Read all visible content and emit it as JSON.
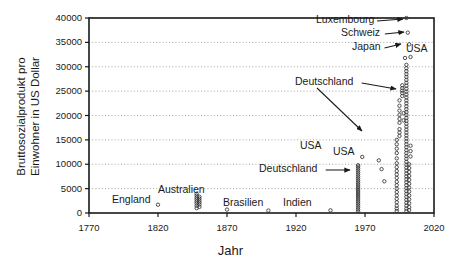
{
  "chart_data": {
    "type": "scatter",
    "title": "",
    "xlabel": "Jahr",
    "ylabel": "Bruttosozialprodukt pro Einwohner in US Dollar",
    "ylabel_line1": "Bruttosozialprodukt pro",
    "ylabel_line2": "Einwohner in US Dollar",
    "xlim": [
      1770,
      2020
    ],
    "ylim": [
      0,
      40000
    ],
    "xticks": [
      1770,
      1820,
      1870,
      1920,
      1970,
      2020
    ],
    "yticks": [
      0,
      5000,
      10000,
      15000,
      20000,
      25000,
      30000,
      35000,
      40000
    ],
    "xtick_labels": [
      "1770",
      "1820",
      "1870",
      "1920",
      "1970",
      "2020"
    ],
    "ytick_labels": [
      "0",
      "5000",
      "10000",
      "15000",
      "20000",
      "25000",
      "30000",
      "35000",
      "40000"
    ],
    "grid": "horizontal-dotted",
    "legend": "none",
    "marker": "open-circle",
    "marker_color": "#333333",
    "points": [
      [
        1820,
        1700
      ],
      [
        1848,
        1000
      ],
      [
        1848,
        1500
      ],
      [
        1848,
        1950
      ],
      [
        1848,
        2350
      ],
      [
        1848,
        2750
      ],
      [
        1848,
        3150
      ],
      [
        1848,
        3550
      ],
      [
        1848,
        3950
      ],
      [
        1850,
        2550
      ],
      [
        1850,
        1250
      ],
      [
        1850,
        1750
      ],
      [
        1850,
        2150
      ],
      [
        1850,
        2950
      ],
      [
        1850,
        3350
      ],
      [
        1870,
        700
      ],
      [
        1900,
        500
      ],
      [
        1945,
        550
      ],
      [
        1965,
        300
      ],
      [
        1965,
        700
      ],
      [
        1965,
        1100
      ],
      [
        1965,
        1500
      ],
      [
        1965,
        1900
      ],
      [
        1965,
        2300
      ],
      [
        1965,
        2700
      ],
      [
        1965,
        3100
      ],
      [
        1965,
        3500
      ],
      [
        1965,
        3900
      ],
      [
        1965,
        4300
      ],
      [
        1965,
        4700
      ],
      [
        1965,
        5100
      ],
      [
        1965,
        5500
      ],
      [
        1965,
        5900
      ],
      [
        1965,
        6300
      ],
      [
        1965,
        6700
      ],
      [
        1965,
        7100
      ],
      [
        1965,
        7500
      ],
      [
        1965,
        7900
      ],
      [
        1965,
        8300
      ],
      [
        1965,
        8700
      ],
      [
        1965,
        9100
      ],
      [
        1965,
        9500
      ],
      [
        1965,
        9800
      ],
      [
        1968,
        11500
      ],
      [
        1980,
        10800
      ],
      [
        1982,
        9000
      ],
      [
        1984,
        6500
      ],
      [
        1993,
        12300
      ],
      [
        1993,
        10200
      ],
      [
        1993,
        11200
      ],
      [
        1993,
        9400
      ],
      [
        1993,
        8600
      ],
      [
        1993,
        7900
      ],
      [
        1993,
        7200
      ],
      [
        1993,
        6400
      ],
      [
        1993,
        5700
      ],
      [
        1993,
        5000
      ],
      [
        1993,
        4300
      ],
      [
        1993,
        3600
      ],
      [
        1993,
        2900
      ],
      [
        1993,
        2200
      ],
      [
        1993,
        1500
      ],
      [
        1993,
        900
      ],
      [
        1993,
        400
      ],
      [
        1993,
        13200
      ],
      [
        1993,
        14100
      ],
      [
        1993,
        15000
      ],
      [
        1995,
        17200
      ],
      [
        1995,
        16500
      ],
      [
        1995,
        15800
      ],
      [
        1995,
        20100
      ],
      [
        1995,
        21000
      ],
      [
        1995,
        19300
      ],
      [
        1995,
        18500
      ],
      [
        1995,
        22000
      ],
      [
        1995,
        23100
      ],
      [
        1997,
        24000
      ],
      [
        1997,
        24600
      ],
      [
        1997,
        25100
      ],
      [
        1997,
        25600
      ],
      [
        1997,
        26200
      ],
      [
        1998,
        20500
      ],
      [
        1998,
        19000
      ],
      [
        1999,
        31800
      ],
      [
        2000,
        40000
      ],
      [
        2001,
        37000
      ],
      [
        2002,
        34600
      ],
      [
        2003,
        32000
      ],
      [
        2000,
        30400
      ],
      [
        2000,
        29700
      ],
      [
        2000,
        29100
      ],
      [
        2000,
        28500
      ],
      [
        2000,
        27900
      ],
      [
        2000,
        27300
      ],
      [
        2000,
        26700
      ],
      [
        2000,
        26100
      ],
      [
        2000,
        25500
      ],
      [
        2000,
        24900
      ],
      [
        2000,
        24300
      ],
      [
        2000,
        23700
      ],
      [
        2000,
        23100
      ],
      [
        2000,
        22500
      ],
      [
        2000,
        21900
      ],
      [
        2000,
        21300
      ],
      [
        2000,
        20700
      ],
      [
        2000,
        20100
      ],
      [
        2000,
        19500
      ],
      [
        2000,
        18900
      ],
      [
        2000,
        18300
      ],
      [
        2000,
        17700
      ],
      [
        2000,
        17100
      ],
      [
        2000,
        16500
      ],
      [
        2000,
        15900
      ],
      [
        2000,
        15300
      ],
      [
        2000,
        14700
      ],
      [
        2000,
        14100
      ],
      [
        2000,
        13500
      ],
      [
        2000,
        12900
      ],
      [
        2000,
        12300
      ],
      [
        2000,
        11700
      ],
      [
        2000,
        11100
      ],
      [
        2000,
        10500
      ],
      [
        2000,
        9900
      ],
      [
        2000,
        9300
      ],
      [
        2000,
        8700
      ],
      [
        2000,
        8100
      ],
      [
        2000,
        7500
      ],
      [
        2000,
        6900
      ],
      [
        2000,
        6300
      ],
      [
        2000,
        5700
      ],
      [
        2000,
        5100
      ],
      [
        2000,
        4500
      ],
      [
        2000,
        3900
      ],
      [
        2000,
        3300
      ],
      [
        2000,
        2700
      ],
      [
        2000,
        2100
      ],
      [
        2000,
        1500
      ],
      [
        2000,
        900
      ],
      [
        2000,
        400
      ],
      [
        2002,
        10000
      ],
      [
        2002,
        9200
      ],
      [
        2002,
        8400
      ],
      [
        2002,
        7600
      ],
      [
        2002,
        6800
      ],
      [
        2002,
        6000
      ],
      [
        2002,
        5200
      ],
      [
        2002,
        4400
      ],
      [
        2002,
        3600
      ],
      [
        2002,
        2800
      ],
      [
        2002,
        2000
      ],
      [
        2002,
        1200
      ],
      [
        2002,
        600
      ],
      [
        2003,
        13800
      ],
      [
        2003,
        12700
      ],
      [
        2003,
        11600
      ]
    ],
    "annotations": [
      {
        "text": "Luxembourg",
        "label_x": 316,
        "label_y": 16,
        "arrow": true,
        "target_x": 403,
        "target_y": 19
      },
      {
        "text": "Schweiz",
        "label_x": 341,
        "label_y": 29,
        "arrow": true,
        "target_x": 404,
        "target_y": 32
      },
      {
        "text": "Japan",
        "label_x": 352,
        "label_y": 43,
        "arrow": true,
        "target_x": 401,
        "target_y": 44
      },
      {
        "text": "USA",
        "label_x": 406,
        "label_y": 45,
        "arrow": false
      },
      {
        "text": "Deutschland",
        "label_x": 295,
        "label_y": 78,
        "arrow": true,
        "target_x": 396,
        "target_y": 89
      },
      {
        "text": "Deutschland",
        "label_x": 295,
        "label_y": 78,
        "arrow": true,
        "target_x": 362,
        "target_y": 131,
        "second": true
      },
      {
        "text": "USA",
        "label_x": 300,
        "label_y": 142,
        "arrow": false
      },
      {
        "text": "USA",
        "label_x": 333,
        "label_y": 148,
        "arrow": false
      },
      {
        "text": "Deutschland",
        "label_x": 259,
        "label_y": 165,
        "arrow": true,
        "target_x": 350,
        "target_y": 170
      },
      {
        "text": "Australien",
        "label_x": 158,
        "label_y": 186,
        "arrow": false
      },
      {
        "text": "England",
        "label_x": 112,
        "label_y": 196,
        "arrow": false
      },
      {
        "text": "Brasilien",
        "label_x": 223,
        "label_y": 199,
        "arrow": false
      },
      {
        "text": "Indien",
        "label_x": 283,
        "label_y": 199,
        "arrow": false
      }
    ]
  },
  "plot_geometry": {
    "left": 89,
    "right": 434,
    "top": 18,
    "bottom": 213
  },
  "colors": {
    "frame": "#1a1a1a",
    "grid": "#999999",
    "marker": "#333333",
    "text": "#1a1a1a",
    "background": "#ffffff"
  }
}
